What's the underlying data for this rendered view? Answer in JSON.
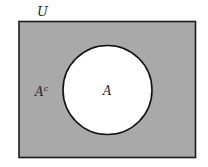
{
  "diagram": {
    "type": "venn",
    "universe": {
      "label": "U",
      "fill": "#a9a9a9",
      "stroke": "#1a1a1a"
    },
    "set_a": {
      "label": "A",
      "fill": "#ffffff",
      "stroke": "#111111"
    },
    "complement": {
      "label_base": "A",
      "label_sup": "c"
    }
  }
}
